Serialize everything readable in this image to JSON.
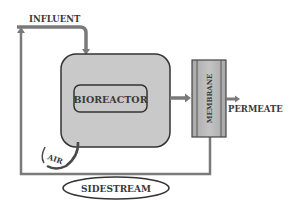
{
  "diagram": {
    "type": "process-flow",
    "labels": {
      "influent": "INFLUENT",
      "bioreactor": "BIOREACTOR",
      "membrane": "MEMBRANE",
      "permeate": "PERMEATE",
      "air": "AIR",
      "sidestream": "SIDESTREAM"
    },
    "colors": {
      "pipe": "#7a7a7a",
      "outline": "#3a3a3a",
      "bioreactor_fill": "#c9c9c9",
      "membrane_fill": "#b0b0b0",
      "background": "#ffffff"
    }
  }
}
